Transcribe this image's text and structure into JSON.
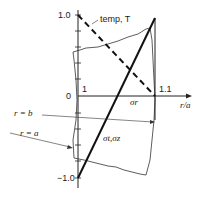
{
  "diagram": {
    "y_axis": {
      "ticks": [
        {
          "label": "1.0",
          "value": 1.0
        },
        {
          "label": "0",
          "value": 0
        },
        {
          "label": "−1.0",
          "value": -1.0
        }
      ]
    },
    "x_axis": {
      "label": "r/a",
      "ticks": [
        {
          "label": "1",
          "value": 1
        },
        {
          "label": "1.1",
          "value": 1.1
        }
      ]
    },
    "curves": [
      {
        "name": "temperature",
        "label": "temp, T",
        "style": "dashed"
      },
      {
        "name": "radial-stress",
        "label": "σr",
        "style": "solid"
      },
      {
        "name": "hoop-axial-stress",
        "label": "σt,σz",
        "style": "solid-thick"
      }
    ],
    "annotations": [
      {
        "label": "r = b"
      },
      {
        "label": "r = a"
      }
    ]
  }
}
